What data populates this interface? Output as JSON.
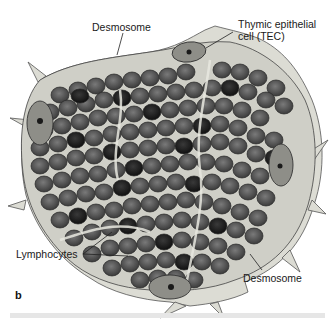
{
  "figure": {
    "panel_letter": "b",
    "labels": {
      "desmosome_top": "Desmosome",
      "tec_line1": "Thymic epithelial",
      "tec_line2": "cell (TEC)",
      "lymphocytes": "Lymphocytes",
      "desmosome_bottom": "Desmosome"
    },
    "colors": {
      "cytoplasm": "#d8d8d0",
      "outline": "#5a5a5a",
      "lymphocyte": "#4a4a4a",
      "lymphocyte_dark": "#1e1e1e",
      "tec_nucleus": "#8c8c86"
    }
  }
}
